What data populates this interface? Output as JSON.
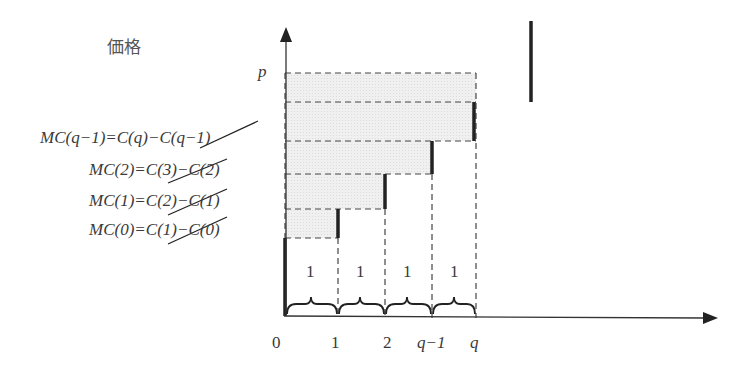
{
  "diagram": {
    "type": "marginal-cost-step-diagram",
    "y_axis_label": "価格",
    "price_label": "p",
    "mc_labels": [
      {
        "id": "mc_q_minus_1",
        "text": "MC(q−1)=C(q)−C(q−1)"
      },
      {
        "id": "mc_2",
        "text": "MC(2)=C(3)−C(2)"
      },
      {
        "id": "mc_1",
        "text": "MC(1)=C(2)−C(1)"
      },
      {
        "id": "mc_0",
        "text": "MC(0)=C(1)−C(0)"
      }
    ],
    "unit_labels": [
      "1",
      "1",
      "1",
      "1"
    ],
    "x_ticks": [
      "0",
      "1",
      "2",
      "q−1",
      "q"
    ],
    "colors": {
      "axis": "#333333",
      "bar": "#222222",
      "dash": "#444444",
      "fill": "#ededed",
      "strike": "#222222"
    }
  }
}
